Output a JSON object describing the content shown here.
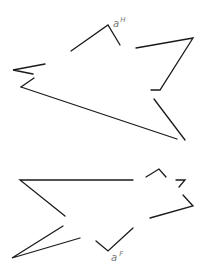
{
  "diagram": {
    "figures": [
      {
        "id": "top",
        "label": {
          "base": "a",
          "sup": "H",
          "x": 113,
          "y": 25
        },
        "polylines": [
          [
            [
              71,
              51
            ],
            [
              108,
              25
            ],
            [
              120,
              45
            ]
          ],
          [
            [
              136,
              48
            ],
            [
              193,
              38
            ],
            [
              160,
              90
            ],
            [
              151,
              90
            ]
          ],
          [
            [
              154,
              99
            ],
            [
              185,
              140
            ]
          ],
          [
            [
              21,
              87
            ],
            [
              177,
              139
            ]
          ],
          [
            [
              21,
              87
            ],
            [
              34,
              78
            ]
          ],
          [
            [
              45,
              64
            ],
            [
              13,
              70
            ],
            [
              33,
              74
            ]
          ]
        ]
      },
      {
        "id": "bottom",
        "label": {
          "base": "a",
          "sup": "F",
          "x": 111,
          "y": 259
        },
        "polylines": [
          [
            [
              133,
              180
            ],
            [
              20,
              180
            ],
            [
              65,
              216
            ]
          ],
          [
            [
              63,
              226
            ],
            [
              12,
              258
            ],
            [
              80,
              238
            ]
          ],
          [
            [
              96,
              241
            ],
            [
              108,
              251
            ],
            [
              133,
              228
            ]
          ],
          [
            [
              146,
              177
            ],
            [
              159,
              169
            ],
            [
              166,
              177
            ]
          ],
          [
            [
              176,
              180
            ],
            [
              185,
              180
            ],
            [
              179,
              187
            ]
          ],
          [
            [
              183,
              195
            ],
            [
              193,
              206
            ],
            [
              150,
              218
            ]
          ]
        ]
      }
    ]
  }
}
